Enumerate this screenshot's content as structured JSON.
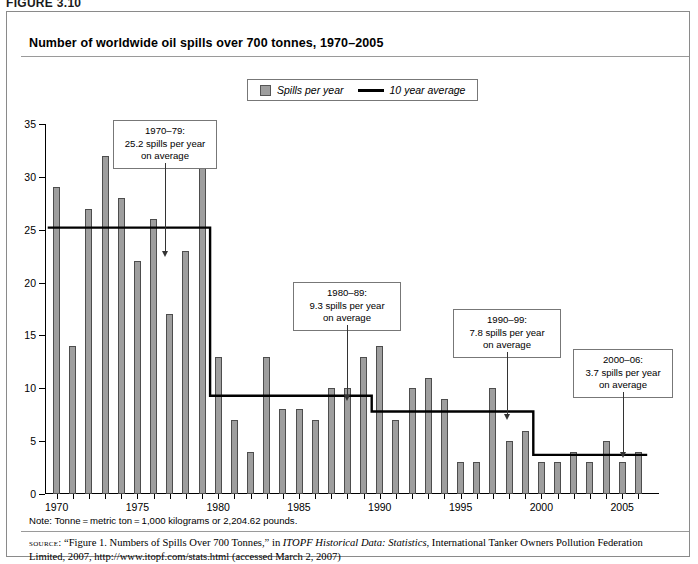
{
  "figure": {
    "label": "FIGURE 3.10",
    "title": "Number of worldwide oil spills over 700 tonnes, 1970–2005"
  },
  "legend": {
    "bars_label": "Spills per year",
    "line_label": "10 year average"
  },
  "annotations": [
    {
      "id": "a1970s",
      "line1": "1970–79:",
      "line2": "25.2 spills per year",
      "line3": "on average"
    },
    {
      "id": "a1980s",
      "line1": "1980–89:",
      "line2": "9.3 spills per year",
      "line3": "on average"
    },
    {
      "id": "a1990s",
      "line1": "1990–99:",
      "line2": "7.8 spills per year",
      "line3": "on average"
    },
    {
      "id": "a2000s",
      "line1": "2000–06:",
      "line2": "3.7 spills per year",
      "line3": "on average"
    }
  ],
  "footer": {
    "note": "Note: Tonne = metric ton = 1,000 kilograms or 2,204.62 pounds.",
    "source_label": "source:",
    "source_part1": "“Figure 1. Numbers of Spills Over 700 Tonnes,” in ",
    "source_italic1": "ITOPF Historical Data: Statistics",
    "source_part2": ", International Tanker Owners Pollution Federation Limited, 2007, http://www.itopf.com/stats.html (accessed March 2, 2007)"
  },
  "colors": {
    "bar_fill": "#9e9e9e",
    "bar_stroke": "#4d4d4d",
    "average_line": "#000000",
    "frame": "#8a8a8a"
  },
  "chart_data": {
    "type": "bar",
    "title": "Number of worldwide oil spills over 700 tonnes, 1970–2005",
    "xlabel": "",
    "ylabel": "",
    "ylim": [
      0,
      35
    ],
    "yticks": [
      0,
      5,
      10,
      15,
      20,
      25,
      30,
      35
    ],
    "xticks": [
      1970,
      1975,
      1980,
      1985,
      1990,
      1995,
      2000,
      2005
    ],
    "grid": false,
    "legend_position": "top-center",
    "categories": [
      1970,
      1971,
      1972,
      1973,
      1974,
      1975,
      1976,
      1977,
      1978,
      1979,
      1980,
      1981,
      1982,
      1983,
      1984,
      1985,
      1986,
      1987,
      1988,
      1989,
      1990,
      1991,
      1992,
      1993,
      1994,
      1995,
      1996,
      1997,
      1998,
      1999,
      2000,
      2001,
      2002,
      2003,
      2004,
      2005,
      2006
    ],
    "series": [
      {
        "name": "Spills per year",
        "type": "bar",
        "values": [
          29,
          14,
          27,
          32,
          28,
          22,
          26,
          17,
          23,
          34,
          13,
          7,
          4,
          13,
          8,
          8,
          7,
          10,
          10,
          13,
          14,
          7,
          10,
          11,
          9,
          3,
          3,
          10,
          5,
          6,
          3,
          3,
          4,
          3,
          5,
          3,
          4
        ]
      },
      {
        "name": "10 year average",
        "type": "step-line",
        "segments": [
          {
            "period": "1970–79",
            "start": 1970,
            "end": 1979,
            "value": 25.2
          },
          {
            "period": "1980–89",
            "start": 1980,
            "end": 1989,
            "value": 9.3
          },
          {
            "period": "1990–99",
            "start": 1990,
            "end": 1999,
            "value": 7.8
          },
          {
            "period": "2000–06",
            "start": 2000,
            "end": 2006,
            "value": 3.7
          }
        ]
      }
    ]
  }
}
